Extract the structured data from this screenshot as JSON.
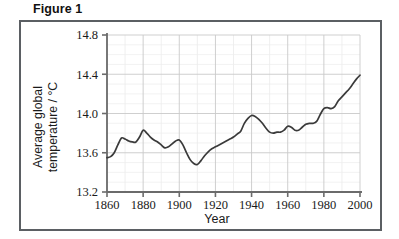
{
  "figure": {
    "title": "Figure 1"
  },
  "chart_data": {
    "type": "line",
    "title": "",
    "xlabel": "Year",
    "ylabel": "Average global temperature / °C",
    "ylabel_line1": "Average global",
    "ylabel_line2": "temperature / °C",
    "xlim": [
      1860,
      2000
    ],
    "ylim": [
      13.2,
      14.8
    ],
    "xticks": [
      1860,
      1880,
      1900,
      1920,
      1940,
      1960,
      1980,
      2000
    ],
    "xtick_labels": [
      "1860",
      "1880",
      "1900",
      "1920",
      "1940",
      "1960",
      "1980",
      "2000"
    ],
    "yticks": [
      13.2,
      13.6,
      14.0,
      14.4,
      14.8
    ],
    "ytick_labels": [
      "13.2",
      "13.6",
      "14.0",
      "14.4",
      "14.8"
    ],
    "x_minor_step": 10,
    "y_minor_step": 0.1,
    "grid": true,
    "legend": "none",
    "series": [
      {
        "name": "Average global temperature",
        "color": "#3a3a3a",
        "x": [
          1860,
          1862,
          1864,
          1866,
          1868,
          1870,
          1872,
          1874,
          1876,
          1878,
          1880,
          1882,
          1884,
          1886,
          1888,
          1890,
          1892,
          1894,
          1896,
          1898,
          1900,
          1902,
          1904,
          1906,
          1908,
          1910,
          1912,
          1914,
          1916,
          1918,
          1920,
          1922,
          1924,
          1926,
          1928,
          1930,
          1932,
          1934,
          1936,
          1938,
          1940,
          1942,
          1944,
          1946,
          1948,
          1950,
          1952,
          1954,
          1956,
          1958,
          1960,
          1962,
          1964,
          1966,
          1968,
          1970,
          1972,
          1974,
          1976,
          1978,
          1980,
          1982,
          1984,
          1986,
          1988,
          1990,
          1992,
          1994,
          1996,
          1998,
          2000
        ],
        "y": [
          13.55,
          13.56,
          13.6,
          13.68,
          13.75,
          13.74,
          13.72,
          13.71,
          13.71,
          13.76,
          13.83,
          13.8,
          13.76,
          13.73,
          13.71,
          13.68,
          13.65,
          13.66,
          13.69,
          13.72,
          13.73,
          13.68,
          13.6,
          13.53,
          13.49,
          13.48,
          13.52,
          13.57,
          13.61,
          13.64,
          13.66,
          13.68,
          13.7,
          13.72,
          13.74,
          13.76,
          13.79,
          13.82,
          13.9,
          13.95,
          13.98,
          13.97,
          13.94,
          13.9,
          13.85,
          13.81,
          13.8,
          13.81,
          13.81,
          13.83,
          13.87,
          13.86,
          13.83,
          13.83,
          13.86,
          13.89,
          13.9,
          13.9,
          13.92,
          13.99,
          14.05,
          14.06,
          14.05,
          14.07,
          14.13,
          14.17,
          14.21,
          14.25,
          14.3,
          14.35,
          14.39
        ]
      }
    ]
  }
}
